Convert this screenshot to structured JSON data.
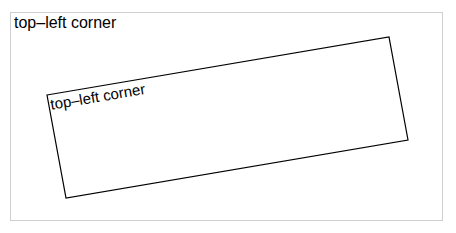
{
  "outer": {
    "label": "top–left corner"
  },
  "inner": {
    "label": "top–left corner",
    "rotation_deg": -9.6
  },
  "colors": {
    "frame_border": "#cfcfcf",
    "rect_stroke": "#000000"
  }
}
